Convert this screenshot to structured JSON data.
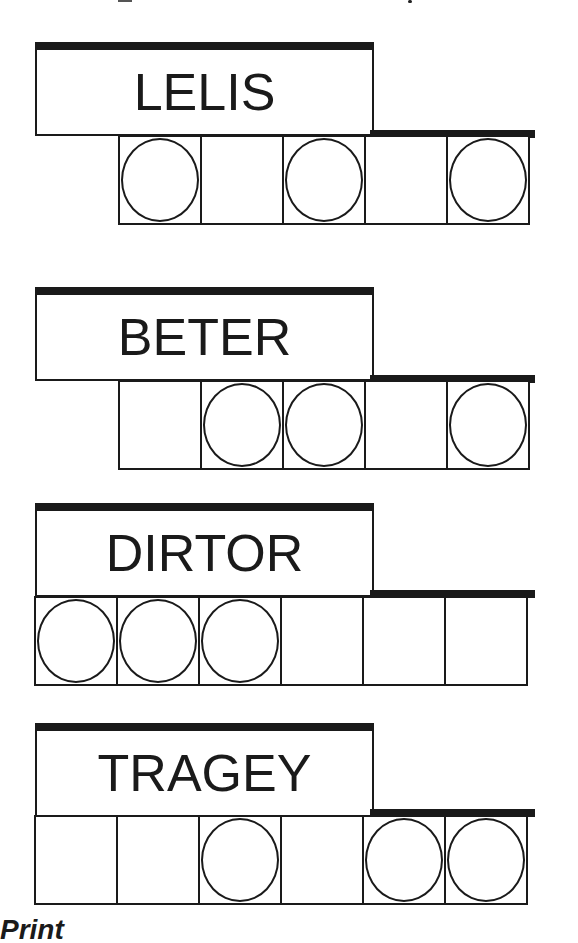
{
  "puzzles": [
    {
      "scrambled": "LELIS",
      "cells": 5,
      "offset": 1,
      "circled": [
        0,
        2,
        4
      ]
    },
    {
      "scrambled": "BETER",
      "cells": 5,
      "offset": 1,
      "circled": [
        1,
        2,
        4
      ]
    },
    {
      "scrambled": "DIRTOR",
      "cells": 6,
      "offset": 0,
      "circled": [
        0,
        1,
        2
      ]
    },
    {
      "scrambled": "TRAGEY",
      "cells": 6,
      "offset": 0,
      "circled": [
        2,
        4,
        5
      ]
    }
  ],
  "footer": {
    "text": "Print"
  }
}
